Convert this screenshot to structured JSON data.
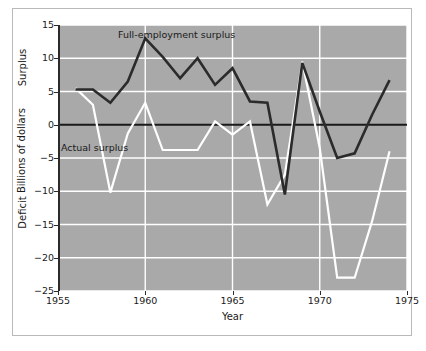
{
  "chart_data": {
    "type": "line",
    "title": "",
    "xlabel": "Year",
    "ylabel": "Billions of dollars",
    "ylabel_positive": "Surplus",
    "ylabel_negative": "Deficit",
    "xlim": [
      1955,
      1975
    ],
    "ylim": [
      -25,
      15
    ],
    "xticks": [
      1955,
      1960,
      1965,
      1970,
      1975
    ],
    "xtick_labels": [
      "1955",
      "1960",
      "1965",
      "1970",
      "1975"
    ],
    "yticks": [
      15,
      10,
      5,
      0,
      -5,
      -10,
      -15,
      -20,
      -25
    ],
    "ytick_labels": [
      "15",
      "10",
      "5",
      "0",
      "−5",
      "−10",
      "−15",
      "−20",
      "−25"
    ],
    "grid": true,
    "grid_color": "#ffffff",
    "plot_background": "#a9a9a9",
    "zero_line": 0,
    "zero_line_color": "#1a1a1a",
    "legend_position": "inline-annotation",
    "x": [
      1956,
      1957,
      1958,
      1959,
      1960,
      1961,
      1962,
      1963,
      1964,
      1965,
      1966,
      1967,
      1968,
      1969,
      1970,
      1971,
      1972,
      1973,
      1974
    ],
    "series": [
      {
        "name": "Full-employment surplus",
        "color": "#2b2b2b",
        "values": [
          5.3,
          5.3,
          3.3,
          6.5,
          13.0,
          10.2,
          7.0,
          10.0,
          6.0,
          8.5,
          3.5,
          3.3,
          -10.5,
          9.3,
          2.0,
          -5.0,
          -4.3,
          1.5,
          6.7
        ]
      },
      {
        "name": "Actual surplus",
        "color": "#ffffff",
        "values": [
          5.5,
          3.0,
          -10.2,
          -1.3,
          3.3,
          -3.8,
          -3.8,
          -3.8,
          0.5,
          -1.5,
          0.5,
          -12.0,
          -7.5,
          9.5,
          -3.5,
          -23.0,
          -23.0,
          -14.5,
          -4.0
        ]
      }
    ],
    "annotations": [
      {
        "text": "Full-employment surplus",
        "x": 1962.2,
        "y": 13.5
      },
      {
        "text": "Actual surplus",
        "x": 1958.5,
        "y": -7.5
      }
    ]
  },
  "axes": {
    "x_title": "Year",
    "y_title": "Billions of dollars",
    "y_upper_region": "Surplus",
    "y_lower_region": "Deficit"
  }
}
